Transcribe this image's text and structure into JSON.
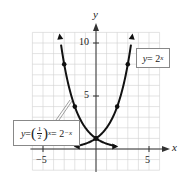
{
  "chart_data": {
    "type": "line",
    "title": "",
    "xlabel": "x",
    "ylabel": "y",
    "xlim": [
      -6,
      6
    ],
    "ylim": [
      -2,
      11
    ],
    "grid": true,
    "x_ticks": [
      -5,
      5
    ],
    "y_ticks": [
      5,
      10
    ],
    "x_tick_labels": [
      "−5",
      "5"
    ],
    "y_tick_labels": [
      "5",
      "10"
    ],
    "series": [
      {
        "name": "y = 2^x",
        "function": "2^x",
        "x": [
          -4,
          -3,
          -2,
          -1,
          0,
          1,
          2,
          3,
          3.3
        ],
        "y": [
          0.0625,
          0.125,
          0.25,
          0.5,
          1,
          2,
          4,
          8,
          9.85
        ],
        "marked_points": [
          [
            0,
            1
          ],
          [
            2,
            4
          ],
          [
            3,
            8
          ]
        ]
      },
      {
        "name": "y = (1/2)^x = 2^-x",
        "function": "2^-x",
        "x": [
          -3.3,
          -3,
          -2,
          -1,
          0,
          1,
          2,
          3,
          4
        ],
        "y": [
          9.85,
          8,
          4,
          2,
          1,
          0.5,
          0.25,
          0.125,
          0.0625
        ],
        "marked_points": [
          [
            -3,
            8
          ],
          [
            -2,
            4
          ],
          [
            0,
            1
          ]
        ]
      }
    ],
    "annotations": [
      {
        "text": "y = 2^x",
        "target_series": 0
      },
      {
        "text": "y = (1/2)^x = 2^-x",
        "target_series": 1
      }
    ]
  },
  "axes": {
    "x_label": "x",
    "y_label": "y",
    "tick_neg5": "−5",
    "tick_5": "5",
    "tick_y5": "5",
    "tick_y10": "10"
  },
  "labels": {
    "right_y": "y",
    "right_eq": " = 2",
    "right_exp": "x",
    "left_y": "y",
    "left_eq": " = ",
    "left_paren_open": "(",
    "left_num": "1",
    "left_den": "2",
    "left_paren_close": ")",
    "left_exp": "x",
    "left_eq2": " = 2",
    "left_exp2": "−x"
  },
  "colors": {
    "curve": "#111111",
    "grid": "#d0d0d0",
    "axis": "#333333"
  }
}
